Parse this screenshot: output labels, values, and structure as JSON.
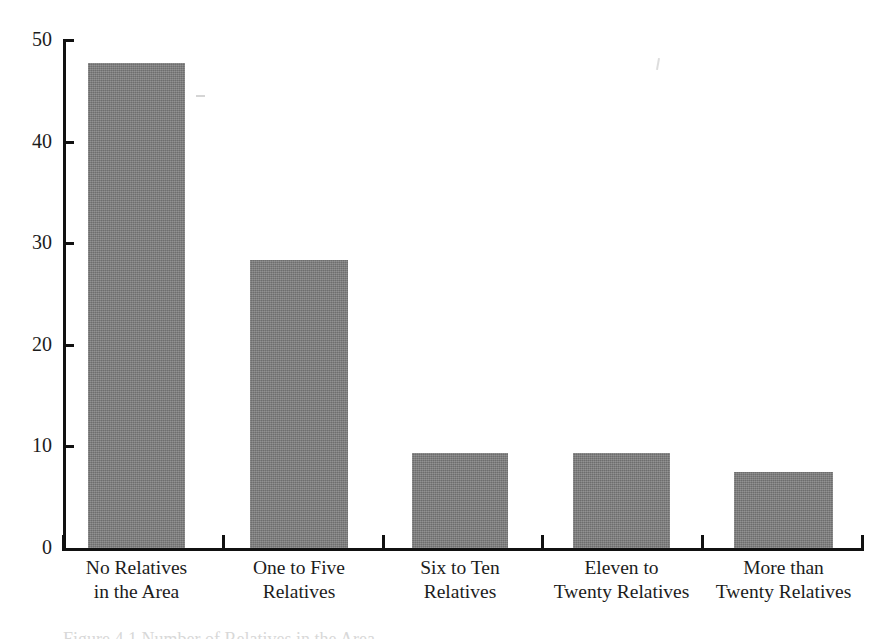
{
  "chart_data": {
    "type": "bar",
    "title": "",
    "subtitle": "",
    "xlabel": "",
    "ylabel": "",
    "ylim": [
      0,
      50
    ],
    "grid": false,
    "legend": "none",
    "categories": [
      "No Relatives\nin the Area",
      "One to Five\nRelatives",
      "Six to Ten\nRelatives",
      "Eleven to\nTwenty Relatives",
      "More than\nTwenty Relatives"
    ],
    "values": [
      47.7,
      28.3,
      9.4,
      9.4,
      7.5
    ],
    "ytick_labels": [
      "0",
      "10",
      "20",
      "30",
      "40",
      "50"
    ],
    "ytick_values": [
      0,
      10,
      20,
      30,
      40,
      50
    ],
    "bar_color": "#7e7e7e",
    "axis_color": "#111111",
    "background_color": "#ffffff"
  },
  "axis": {
    "y": {
      "ticks": [
        {
          "label": "50",
          "value": 50
        },
        {
          "label": "40",
          "value": 40
        },
        {
          "label": "30",
          "value": 30
        },
        {
          "label": "20",
          "value": 20
        },
        {
          "label": "10",
          "value": 10
        },
        {
          "label": "0",
          "value": 0
        }
      ]
    },
    "x": {
      "separator_count": 6
    }
  },
  "bars": [
    {
      "name": "no-relatives-in-the-area",
      "label": "No Relatives\nin the Area",
      "value": 47.7,
      "left": 88,
      "width": 97
    },
    {
      "name": "one-to-five-relatives",
      "label": "One to Five\nRelatives",
      "value": 28.3,
      "left": 250,
      "width": 98
    },
    {
      "name": "six-to-ten-relatives",
      "label": "Six to Ten\nRelatives",
      "value": 9.4,
      "left": 412,
      "width": 96
    },
    {
      "name": "eleven-to-twenty-relatives",
      "label": "Eleven to\nTwenty Relatives",
      "value": 9.4,
      "left": 573,
      "width": 97
    },
    {
      "name": "more-than-twenty-relatives",
      "label": "More than\nTwenty Relatives",
      "value": 7.5,
      "left": 734,
      "width": 99
    }
  ],
  "caption": {
    "clipped_text": "Figure 4.1  Number of Relatives in the Area"
  }
}
